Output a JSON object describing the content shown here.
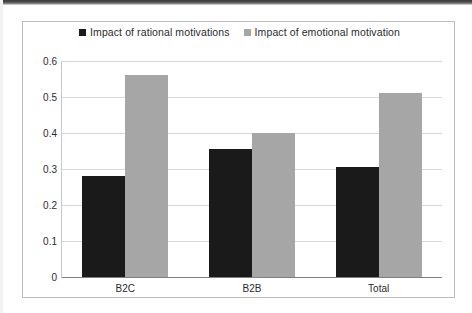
{
  "chart_data": {
    "type": "bar",
    "title": "",
    "subtitle": "",
    "xlabel": "",
    "ylabel": "",
    "categories": [
      "B2C",
      "B2B",
      "Total"
    ],
    "series": [
      {
        "name": "Impact of rational motivations",
        "color": "#1a1a1a",
        "values": [
          0.28,
          0.355,
          0.305
        ]
      },
      {
        "name": "Impact of emotional motivation",
        "color": "#a6a6a6",
        "values": [
          0.56,
          0.4,
          0.51
        ]
      }
    ],
    "ylim": [
      0,
      0.6
    ],
    "yticks": [
      "0",
      "0.1",
      "0.2",
      "0.3",
      "0.4",
      "0.5",
      "0.6"
    ],
    "ytick_values": [
      0,
      0.1,
      0.2,
      0.3,
      0.4,
      0.5,
      0.6
    ],
    "grid": true,
    "legend_position": "top",
    "annotations": []
  },
  "legend": {
    "entries": [
      {
        "label": "Impact of rational motivations",
        "swatch": "legend-swatch-black"
      },
      {
        "label": "Impact of emotional motivation",
        "swatch": "legend-swatch-gray"
      }
    ]
  }
}
